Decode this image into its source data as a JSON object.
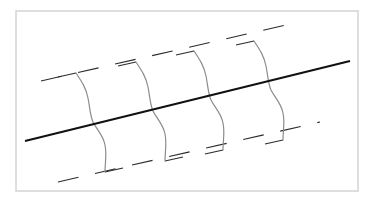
{
  "figure": {
    "width": 370,
    "height": 203,
    "background_color": "#ffffff"
  },
  "frame": {
    "name": "figure-border",
    "x": 16,
    "y": 11,
    "width": 342,
    "height": 180,
    "stroke_color": "#d6d6d6",
    "stroke_width": 1.6,
    "fill_color": "#ffffff"
  },
  "diagonal_line": {
    "name": "main-diagonal",
    "x1": 25,
    "y1": 141,
    "x2": 350,
    "y2": 61,
    "stroke_color": "#111111",
    "stroke_width": 2.3,
    "linecap": "butt"
  },
  "dashed_lines": [
    {
      "name": "upper-dashed-guide",
      "x1": 41,
      "y1": 81,
      "x2": 295,
      "y2": 23,
      "stroke_color": "#2b2b2b",
      "stroke_width": 1.1,
      "dash_pattern": "21 17"
    },
    {
      "name": "lower-dashed-guide",
      "x1": 58,
      "y1": 182,
      "x2": 320,
      "y2": 122,
      "stroke_color": "#2b2b2b",
      "stroke_width": 1.1,
      "dash_pattern": "21 17"
    }
  ],
  "curves": {
    "stroke_color": "#8c8c8c",
    "stroke_width": 1.2,
    "fill": "none",
    "count": 4,
    "items": [
      {
        "name": "sigmoid-curve-1",
        "path": "M 76 73 C 82 82 86 88 88 98 C 90 108 90 115 93 122 C 97 130 103 135 105 145 C 107 155 105 162 105 172"
      },
      {
        "name": "sigmoid-curve-2",
        "path": "M 136 62 C 142 71 146 77 148 87 C 150 97 150 104 153 111 C 157 119 163 124 165 134 C 167 144 165 151 165 161"
      },
      {
        "name": "sigmoid-curve-3",
        "path": "M 194 51 C 200 60 204 66 206 76 C 208 86 208 93 211 100 C 215 108 221 113 223 123 C 225 133 223 140 223 150"
      },
      {
        "name": "sigmoid-curve-4",
        "path": "M 254 41 C 260 50 264 56 266 66 C 268 76 268 83 271 90 C 275 98 281 103 283 113 C 285 123 283 130 283 140"
      }
    ]
  },
  "tick_marks": {
    "stroke_color": "#2b2b2b",
    "stroke_width": 1.1,
    "description": "Short dash segments of the guide lines that terminate at each curve endpoint",
    "items": [
      {
        "name": "tick-top-1",
        "x1": 58,
        "y1": 77,
        "x2": 76,
        "y2": 73
      },
      {
        "name": "tick-top-2",
        "x1": 118,
        "y1": 66,
        "x2": 136,
        "y2": 62
      },
      {
        "name": "tick-top-3",
        "x1": 176,
        "y1": 55,
        "x2": 194,
        "y2": 51
      },
      {
        "name": "tick-top-4",
        "x1": 236,
        "y1": 45,
        "x2": 254,
        "y2": 41
      },
      {
        "name": "tick-bottom-1",
        "x1": 105,
        "y1": 172,
        "x2": 123,
        "y2": 168
      },
      {
        "name": "tick-bottom-2",
        "x1": 165,
        "y1": 161,
        "x2": 183,
        "y2": 157
      },
      {
        "name": "tick-bottom-3",
        "x1": 205,
        "y1": 154,
        "x2": 223,
        "y2": 150
      },
      {
        "name": "tick-bottom-4",
        "x1": 265,
        "y1": 144,
        "x2": 283,
        "y2": 140
      }
    ]
  }
}
